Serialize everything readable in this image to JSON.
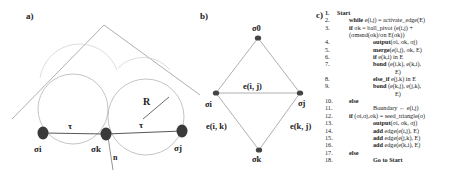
{
  "panels": {
    "a": {
      "label": "a)",
      "nodes": [
        {
          "id": "si",
          "label": "σi",
          "x": 43,
          "y": 133
        },
        {
          "id": "sk",
          "label": "σk",
          "x": 106,
          "y": 134
        },
        {
          "id": "sj",
          "label": "σj",
          "x": 182,
          "y": 131
        }
      ],
      "edge_labels": {
        "tau_left": "τ",
        "tau_right": "τ"
      },
      "radius_label": "R",
      "normal_label": "n"
    },
    "b": {
      "label": "b)",
      "nodes": [
        {
          "id": "s0",
          "label": "σ0",
          "x": 258,
          "y": 38
        },
        {
          "id": "si",
          "label": "σi",
          "x": 216,
          "y": 93
        },
        {
          "id": "sj",
          "label": "σj",
          "x": 300,
          "y": 93
        },
        {
          "id": "sk",
          "label": "σk",
          "x": 259,
          "y": 150
        }
      ],
      "edges": {
        "ij": "e(i, j)",
        "ik": "e(i, k)",
        "kj": "e(k, j)"
      }
    },
    "c": {
      "label": "c)",
      "lines": [
        {
          "num": "1.",
          "indent": 0,
          "bold": "Start",
          "rest": ""
        },
        {
          "num": "2.",
          "indent": 1,
          "bold": "while",
          "rest": " e(i,j) = activate_edge(E)"
        },
        {
          "num": "3.",
          "indent": 1,
          "bold": "if",
          "rest": " σk = ball_pivot (e(i,j) +"
        },
        {
          "num": "",
          "indent": 1,
          "bold": "",
          "rest": "(σmsnd(σk)/σn E(σk))"
        },
        {
          "num": "4.",
          "indent": 3,
          "bold": "output",
          "rest": "(σi, σk, σj)"
        },
        {
          "num": "5.",
          "indent": 3,
          "bold": "merge",
          "rest": "(e(i,j), σk, E)"
        },
        {
          "num": "6.",
          "indent": 3,
          "bold": "if",
          "rest": " e(k,i) in E"
        },
        {
          "num": "7.",
          "indent": 3,
          "bold": "bond",
          "rest": " (e(i,k), e(k,i),"
        },
        {
          "num": "",
          "indent": 5,
          "bold": "",
          "rest": "E)"
        },
        {
          "num": "8.",
          "indent": 3,
          "bold": "else_if",
          "rest": " e(j,k) in E"
        },
        {
          "num": "9.",
          "indent": 3,
          "bold": "bond",
          "rest": " (e(k,j), e(j,k),"
        },
        {
          "num": "",
          "indent": 5,
          "bold": "",
          "rest": "E)"
        },
        {
          "num": "10.",
          "indent": 1,
          "bold": "else",
          "rest": ""
        },
        {
          "num": "11.",
          "indent": 3,
          "bold": "",
          "rest": "Boundary ← e(i,j)"
        },
        {
          "num": "12.",
          "indent": 1,
          "bold": "if",
          "rest": " (σi,σj,σk) = seed_triangle(σ)"
        },
        {
          "num": "13.",
          "indent": 3,
          "bold": "output",
          "rest": "(σi, σk, σj)"
        },
        {
          "num": "14.",
          "indent": 3,
          "bold": "add",
          "rest": " edge(e(i,j), E)"
        },
        {
          "num": "15.",
          "indent": 3,
          "bold": "add",
          "rest": " edge(e(j,k), E)"
        },
        {
          "num": "16.",
          "indent": 3,
          "bold": "add",
          "rest": " edge(e(k,i), E)"
        },
        {
          "num": "17.",
          "indent": 1,
          "bold": "else",
          "rest": ""
        },
        {
          "num": "18.",
          "indent": 3,
          "bold": "Go to Start",
          "rest": ""
        }
      ]
    }
  },
  "colors": {
    "line": "#9a9a9a",
    "circle": "#b5b5b5",
    "node": "#3a3a3a",
    "text": "#222222"
  }
}
